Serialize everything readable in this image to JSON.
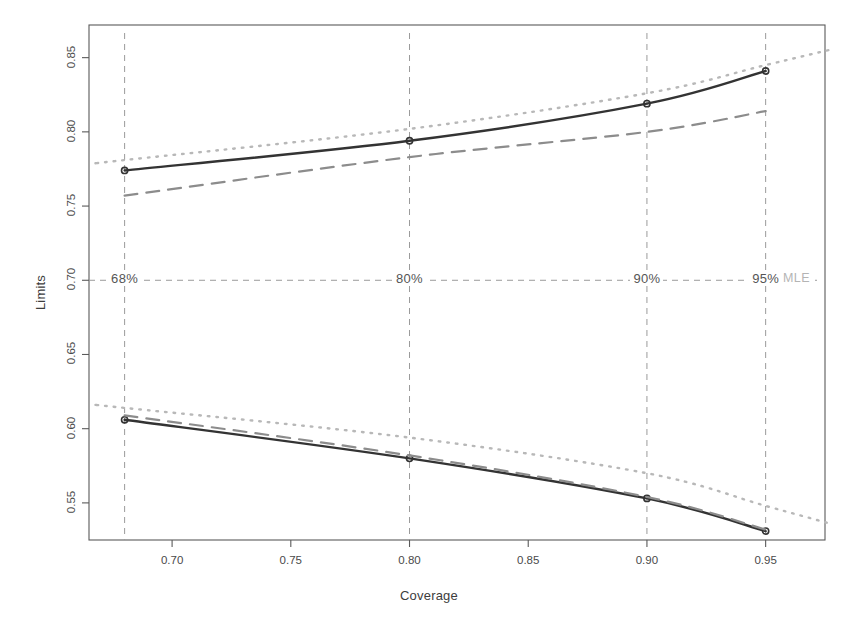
{
  "chart_data": {
    "type": "line",
    "title": "",
    "xlabel": "Coverage",
    "ylabel": "Limits",
    "xlim": [
      0.665,
      0.975
    ],
    "ylim": [
      0.525,
      0.872
    ],
    "xticks": [
      "0.70",
      "0.75",
      "0.80",
      "0.85",
      "0.90",
      "0.95"
    ],
    "xtick_values": [
      0.7,
      0.75,
      0.8,
      0.85,
      0.9,
      0.95
    ],
    "yticks": [
      "0.55",
      "0.60",
      "0.65",
      "0.70",
      "0.75",
      "0.80",
      "0.85"
    ],
    "ytick_values": [
      0.55,
      0.6,
      0.65,
      0.7,
      0.75,
      0.8,
      0.85
    ],
    "grid": false,
    "legend_position": "none",
    "x": [
      0.68,
      0.8,
      0.9,
      0.95
    ],
    "series": [
      {
        "name": "upper-solid",
        "style": "solid",
        "color": "#333333",
        "markers": true,
        "values": [
          0.774,
          0.794,
          0.819,
          0.841
        ]
      },
      {
        "name": "upper-dashed",
        "style": "dashed",
        "color": "#8c8c8c",
        "markers": false,
        "values": [
          0.757,
          0.783,
          0.8,
          0.814
        ]
      },
      {
        "name": "upper-dotted",
        "style": "dotted",
        "color": "#b8b8b8",
        "markers": false,
        "values": [
          0.781,
          0.802,
          0.826,
          0.845
        ]
      },
      {
        "name": "lower-solid",
        "style": "solid",
        "color": "#333333",
        "markers": true,
        "values": [
          0.606,
          0.58,
          0.553,
          0.531
        ]
      },
      {
        "name": "lower-dashed",
        "style": "dashed",
        "color": "#8c8c8c",
        "markers": false,
        "values": [
          0.609,
          0.582,
          0.554,
          0.532
        ]
      },
      {
        "name": "lower-dotted",
        "style": "dotted",
        "color": "#b8b8b8",
        "markers": false,
        "values": [
          0.614,
          0.594,
          0.57,
          0.548
        ]
      }
    ],
    "vertical_reference_lines": [
      {
        "x": 0.68,
        "label": "68%"
      },
      {
        "x": 0.8,
        "label": "80%"
      },
      {
        "x": 0.9,
        "label": "90%"
      },
      {
        "x": 0.95,
        "label": "95%"
      }
    ],
    "horizontal_reference_line": {
      "y": 0.7,
      "label": "MLE"
    },
    "annotations": [
      {
        "text": "68%",
        "x": 0.68,
        "y": 0.7
      },
      {
        "text": "80%",
        "x": 0.8,
        "y": 0.7
      },
      {
        "text": "90%",
        "x": 0.9,
        "y": 0.7
      },
      {
        "text": "95%",
        "x": 0.95,
        "y": 0.7
      },
      {
        "text": "MLE",
        "x": 0.963,
        "y": 0.7
      }
    ],
    "colors": {
      "solid": "#333333",
      "dashed": "#8c8c8c",
      "dotted": "#b8b8b8",
      "reference": "#9a9a9a",
      "axis": "#5a5a5a",
      "mle_text": "#b4b4b4"
    }
  }
}
